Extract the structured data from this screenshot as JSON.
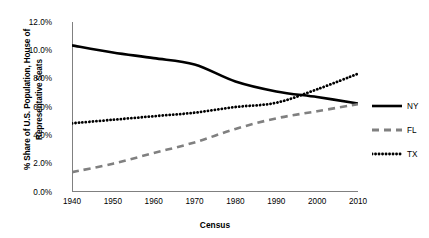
{
  "chart_data": {
    "type": "line",
    "title": "",
    "xlabel": "Census",
    "ylabel": "% Share of U.S. Population, House of\nRepresentative Seats",
    "x": [
      1940,
      1950,
      1960,
      1970,
      1980,
      1990,
      2000,
      2010
    ],
    "xlim": [
      1940,
      2010
    ],
    "ylim": [
      0.0,
      12.0
    ],
    "ytick_labels": [
      "12.0%",
      "10.0%",
      "8.0%",
      "6.0%",
      "4.0%",
      "2.0%",
      "0.0%"
    ],
    "ytick_values": [
      12.0,
      10.0,
      8.0,
      6.0,
      4.0,
      2.0,
      0.0
    ],
    "xtick_labels": [
      "1940",
      "1950",
      "1960",
      "1970",
      "1980",
      "1990",
      "2000",
      "2010"
    ],
    "grid": false,
    "legend_position": "right",
    "series": [
      {
        "name": "NY",
        "style": "solid",
        "color": "#000000",
        "values": [
          10.35,
          9.85,
          9.45,
          9.0,
          7.8,
          7.1,
          6.7,
          6.25
        ]
      },
      {
        "name": "FL",
        "style": "dashed",
        "color": "#808080",
        "values": [
          1.4,
          2.0,
          2.75,
          3.5,
          4.45,
          5.2,
          5.7,
          6.2
        ]
      },
      {
        "name": "TX",
        "style": "dotted",
        "color": "#000000",
        "values": [
          4.85,
          5.1,
          5.35,
          5.6,
          6.0,
          6.3,
          7.25,
          8.35
        ]
      }
    ]
  },
  "axis": {
    "line_color": "#808080"
  },
  "legend": {
    "items": [
      {
        "label": "NY",
        "style": "solid",
        "color": "#000000"
      },
      {
        "label": "FL",
        "style": "dashed",
        "color": "#808080"
      },
      {
        "label": "TX",
        "style": "dotted",
        "color": "#000000"
      }
    ]
  }
}
